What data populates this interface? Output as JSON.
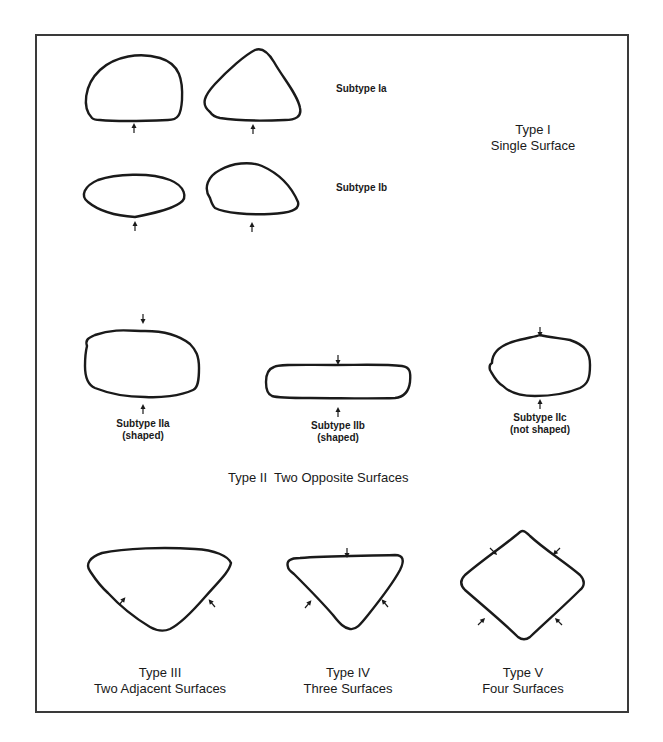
{
  "figure": {
    "type_i": {
      "title": "Type I",
      "subtitle": "Single Surface",
      "subtypes": [
        {
          "label": "Subtype Ia"
        },
        {
          "label": "Subtype Ib"
        }
      ]
    },
    "type_ii": {
      "title": "Type II  Two Opposite Surfaces",
      "subtypes": [
        {
          "label": "Subtype IIa",
          "note": "(shaped)"
        },
        {
          "label": "Subtype IIb",
          "note": "(shaped)"
        },
        {
          "label": "Subtype IIc",
          "note": "(not shaped)"
        }
      ]
    },
    "type_iii": {
      "title": "Type III",
      "subtitle": "Two Adjacent Surfaces"
    },
    "type_iv": {
      "title": "Type IV",
      "subtitle": "Three Surfaces"
    },
    "type_v": {
      "title": "Type V",
      "subtitle": "Four Surfaces"
    }
  },
  "colors": {
    "stroke": "#1a1a1a",
    "frame": "#3a3a3a",
    "background": "#ffffff"
  }
}
